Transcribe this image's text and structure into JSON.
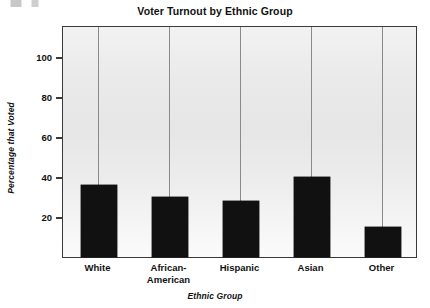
{
  "chart_data": {
    "type": "bar",
    "title": "Voter Turnout by Ethnic Group",
    "xlabel": "Ethnic Group",
    "ylabel": "Percentage that Voted",
    "categories": [
      "White",
      "African-American",
      "Hispanic",
      "Asian",
      "Other"
    ],
    "category_lines": [
      [
        "White"
      ],
      [
        "African-",
        "American"
      ],
      [
        "Hispanic"
      ],
      [
        "Asian"
      ],
      [
        "Other"
      ]
    ],
    "values": [
      36,
      30,
      28,
      40,
      15
    ],
    "ylim": [
      0,
      115
    ],
    "yticks": [
      20,
      40,
      60,
      80,
      100
    ],
    "ytick_labels": [
      "20",
      "40",
      "60",
      "80",
      "100"
    ],
    "grid": "vertical-category-separators",
    "legend": "none",
    "bar_color": "#111111",
    "plot_background": "#ebebeb",
    "axis_color": "#3a3a3a"
  }
}
